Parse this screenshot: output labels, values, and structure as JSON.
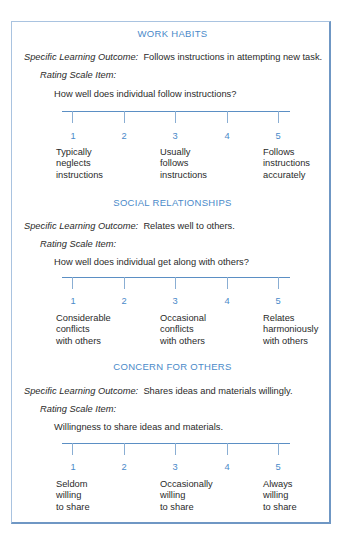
{
  "sections": [
    {
      "heading": "WORK HABITS",
      "outcome_label": "Specific Learning Outcome:",
      "outcome_text": "Follows instructions in attempting new task.",
      "rating_label": "Rating Scale Item:",
      "question": "How well does individual follow instructions?",
      "scale_points": [
        "1",
        "2",
        "3",
        "4",
        "5"
      ],
      "anchors": [
        {
          "point": "1",
          "lines": [
            "Typically",
            "neglects",
            "instructions"
          ]
        },
        {
          "point": "3",
          "lines": [
            "Usually",
            "follows",
            "instructions"
          ]
        },
        {
          "point": "5",
          "lines": [
            "Follows",
            "instructions",
            "accurately"
          ]
        }
      ]
    },
    {
      "heading": "SOCIAL RELATIONSHIPS",
      "outcome_label": "Specific Learning Outcome:",
      "outcome_text": "Relates well to others.",
      "rating_label": "Rating Scale Item:",
      "question": "How well does individual get along with others?",
      "scale_points": [
        "1",
        "2",
        "3",
        "4",
        "5"
      ],
      "anchors": [
        {
          "point": "1",
          "lines": [
            "Considerable",
            "conflicts",
            "with others"
          ]
        },
        {
          "point": "3",
          "lines": [
            "Occasional",
            "conflicts",
            "with others"
          ]
        },
        {
          "point": "5",
          "lines": [
            "Relates",
            "harmoniously",
            "with others"
          ]
        }
      ]
    },
    {
      "heading": "CONCERN FOR OTHERS",
      "outcome_label": "Specific Learning Outcome:",
      "outcome_text": "Shares ideas and materials willingly.",
      "rating_label": "Rating Scale Item:",
      "question": "Willingness to share ideas and materials.",
      "scale_points": [
        "1",
        "2",
        "3",
        "4",
        "5"
      ],
      "anchors": [
        {
          "point": "1",
          "lines": [
            "Seldom",
            "willing",
            "to share"
          ]
        },
        {
          "point": "3",
          "lines": [
            "Occasionally",
            "willing",
            "to share"
          ]
        },
        {
          "point": "5",
          "lines": [
            "Always",
            "willing",
            "to share"
          ]
        }
      ]
    }
  ],
  "colors": {
    "heading": "#4a8ac9",
    "scale_line": "#5b8fc4",
    "frame": "#8fb0d4",
    "text": "#2a2a2a"
  }
}
